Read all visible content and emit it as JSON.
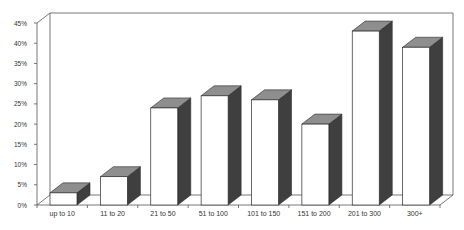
{
  "chart_data": {
    "type": "bar",
    "style": "3d-column",
    "title": "",
    "xlabel": "",
    "ylabel": "",
    "categories": [
      "up to 10",
      "11 to 20",
      "21 to 50",
      "51 to 100",
      "101 to 150",
      "151 to 200",
      "201 to 300",
      "300+"
    ],
    "values": [
      3,
      7,
      24,
      27,
      26,
      20,
      43,
      39
    ],
    "value_format": "percent",
    "ylim": [
      0,
      45
    ],
    "yticks": [
      0,
      5,
      10,
      15,
      20,
      25,
      30,
      35,
      40,
      45
    ],
    "ytick_labels": [
      "0%",
      "5%",
      "10%",
      "15%",
      "20%",
      "25%",
      "30%",
      "35%",
      "40%",
      "45%"
    ],
    "grid": false,
    "legend": null
  },
  "colors": {
    "front": "#ffffff",
    "top": "#8e8e8e",
    "side": "#3f3f3f",
    "outline": "#2a2a2a",
    "axis": "#555555"
  }
}
